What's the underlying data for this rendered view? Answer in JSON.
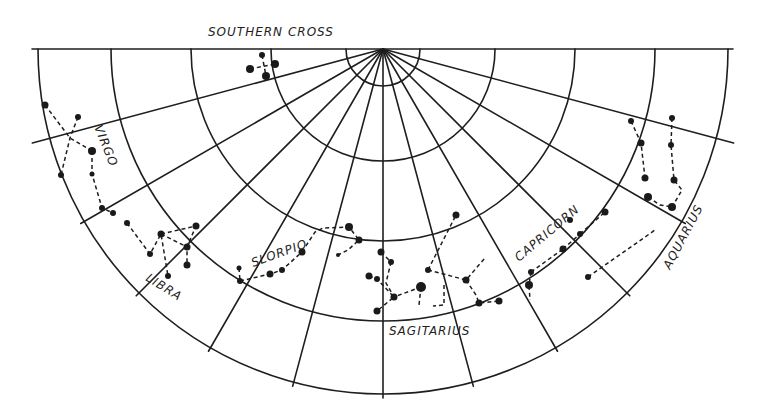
{
  "title": "SOUTHERN CROSS",
  "chart": {
    "center": [
      383,
      49
    ],
    "radii": [
      37,
      112,
      192,
      272,
      345
    ],
    "spoke_angles_deg": [
      15,
      30,
      45,
      60,
      75,
      90,
      105,
      120,
      135,
      150,
      165
    ],
    "extended_spokes": [
      15,
      165
    ],
    "horizon": {
      "x1": 32,
      "x2": 733,
      "y": 49
    },
    "ink_color": "#1e1e1e",
    "background": "#ffffff"
  },
  "labels": {
    "southern_cross": "SOUTHERN CROSS",
    "virgo": "VIRGO",
    "libra": "LIBRA",
    "scorpio": "SLORPIO",
    "sagittarius": "SAGITARIUS",
    "capricorn": "CAPRICORN",
    "aquarius": "AQUARIUS"
  },
  "constellations": [
    {
      "name": "Southern Cross",
      "stars": [
        [
          262,
          55,
          3
        ],
        [
          250,
          69,
          4
        ],
        [
          275,
          64,
          4
        ],
        [
          266,
          76,
          4
        ]
      ],
      "lines": [
        [
          [
            262,
            55
          ],
          [
            266,
            76
          ]
        ],
        [
          [
            250,
            69
          ],
          [
            275,
            64
          ]
        ]
      ]
    },
    {
      "name": "Virgo",
      "stars": [
        [
          45,
          105,
          3.5
        ],
        [
          78,
          117,
          3
        ],
        [
          92,
          151,
          4
        ],
        [
          61,
          175,
          3
        ],
        [
          92,
          174,
          2.5
        ],
        [
          102,
          208,
          3
        ],
        [
          113,
          213,
          3
        ]
      ],
      "lines": [
        [
          [
            45,
            105
          ],
          [
            70,
            138
          ],
          [
            92,
            151
          ]
        ],
        [
          [
            78,
            117
          ],
          [
            70,
            138
          ],
          [
            61,
            175
          ]
        ],
        [
          [
            92,
            151
          ],
          [
            92,
            174
          ],
          [
            102,
            208
          ],
          [
            113,
            213
          ]
        ]
      ]
    },
    {
      "name": "Libra",
      "stars": [
        [
          127,
          223,
          3
        ],
        [
          150,
          254,
          3
        ],
        [
          161,
          234,
          3.5
        ],
        [
          168,
          276,
          3
        ],
        [
          196,
          226,
          3.5
        ],
        [
          187,
          247,
          3.5
        ],
        [
          187,
          265,
          3.5
        ]
      ],
      "lines": [
        [
          [
            127,
            223
          ],
          [
            150,
            254
          ],
          [
            161,
            234
          ],
          [
            168,
            276
          ]
        ],
        [
          [
            161,
            234
          ],
          [
            196,
            226
          ],
          [
            187,
            247
          ],
          [
            187,
            265
          ]
        ],
        [
          [
            161,
            234
          ],
          [
            187,
            247
          ]
        ]
      ]
    },
    {
      "name": "Scorpio",
      "stars": [
        [
          239,
          268,
          2.5
        ],
        [
          240,
          281,
          3
        ],
        [
          270,
          274,
          3.5
        ],
        [
          282,
          270,
          3
        ],
        [
          302,
          252,
          3.5
        ],
        [
          349,
          227,
          4
        ],
        [
          359,
          240,
          3.5
        ],
        [
          338,
          255,
          2
        ]
      ],
      "lines": [
        [
          [
            240,
            281
          ],
          [
            270,
            274
          ],
          [
            282,
            270
          ],
          [
            302,
            252
          ]
        ],
        [
          [
            302,
            252
          ],
          [
            315,
            232
          ],
          [
            323,
            228
          ],
          [
            349,
            227
          ],
          [
            359,
            240
          ],
          [
            348,
            250
          ],
          [
            338,
            255
          ]
        ],
        [
          [
            239,
            268
          ],
          [
            240,
            281
          ]
        ]
      ]
    },
    {
      "name": "Sagittarius",
      "stars": [
        [
          381,
          252,
          3.5
        ],
        [
          391,
          262,
          3
        ],
        [
          369,
          276,
          3.5
        ],
        [
          377,
          279,
          3
        ],
        [
          394,
          297,
          3.5
        ],
        [
          421,
          287,
          5
        ],
        [
          377,
          311,
          3.5
        ],
        [
          466,
          280,
          3.5
        ],
        [
          479,
          303,
          3.5
        ],
        [
          499,
          301,
          3.5
        ],
        [
          456,
          215,
          3.5
        ],
        [
          428,
          270,
          3
        ]
      ],
      "lines": [
        [
          [
            381,
            252
          ],
          [
            391,
            262
          ],
          [
            386,
            283
          ],
          [
            394,
            297
          ],
          [
            421,
            287
          ]
        ],
        [
          [
            369,
            276
          ],
          [
            377,
            279
          ],
          [
            394,
            297
          ],
          [
            377,
            311
          ]
        ],
        [
          [
            428,
            270
          ],
          [
            456,
            215
          ]
        ],
        [
          [
            428,
            270
          ],
          [
            466,
            280
          ],
          [
            485,
            258
          ]
        ],
        [
          [
            466,
            280
          ],
          [
            476,
            295
          ],
          [
            479,
            303
          ],
          [
            499,
            301
          ]
        ],
        [
          [
            421,
            287
          ],
          [
            419,
            305
          ]
        ],
        [
          [
            444,
            285
          ],
          [
            444,
            305
          ],
          [
            433,
            306
          ]
        ]
      ]
    },
    {
      "name": "Capricorn",
      "stars": [
        [
          570,
          220,
          3
        ],
        [
          580,
          234,
          3
        ],
        [
          605,
          212,
          3.5
        ],
        [
          563,
          249,
          3.5
        ],
        [
          531,
          272,
          3
        ],
        [
          529,
          285,
          4
        ],
        [
          588,
          277,
          3
        ]
      ],
      "lines": [
        [
          [
            580,
            234
          ],
          [
            605,
            212
          ]
        ],
        [
          [
            563,
            249
          ],
          [
            580,
            234
          ]
        ],
        [
          [
            531,
            272
          ],
          [
            563,
            249
          ]
        ],
        [
          [
            531,
            272
          ],
          [
            529,
            285
          ],
          [
            530,
            300
          ]
        ],
        [
          [
            588,
            277
          ],
          [
            655,
            230
          ]
        ]
      ]
    },
    {
      "name": "Aquarius",
      "stars": [
        [
          631,
          121,
          3
        ],
        [
          672,
          118,
          3
        ],
        [
          641,
          143,
          3.5
        ],
        [
          671,
          145,
          3
        ],
        [
          645,
          178,
          3.5
        ],
        [
          674,
          180,
          3.5
        ],
        [
          648,
          197,
          4
        ],
        [
          672,
          207,
          4
        ]
      ],
      "lines": [
        [
          [
            631,
            121
          ],
          [
            641,
            143
          ],
          [
            645,
            178
          ]
        ],
        [
          [
            672,
            118
          ],
          [
            671,
            145
          ],
          [
            674,
            180
          ],
          [
            682,
            190
          ],
          [
            672,
            207
          ]
        ],
        [
          [
            648,
            197
          ],
          [
            660,
            205
          ],
          [
            672,
            207
          ]
        ]
      ]
    }
  ]
}
